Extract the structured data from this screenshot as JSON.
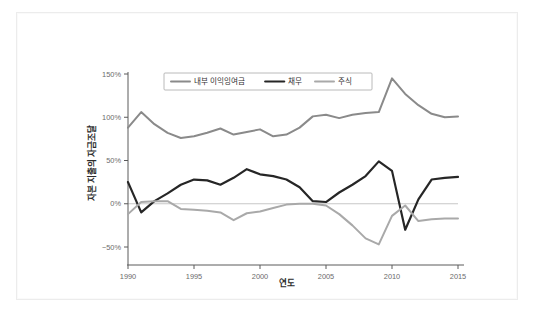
{
  "figure": {
    "background": "#ffffff",
    "frame_color": "#ececec"
  },
  "chart_data": {
    "type": "line",
    "title": "",
    "subtitle": "",
    "xlabel": "연도",
    "ylabel": "자본 지출의 자금조달",
    "xlim": [
      1990,
      2015
    ],
    "ylim": [
      -50,
      150
    ],
    "grid": false,
    "zero_line": true,
    "legend_position": "top-center-inside",
    "xticks": [
      1990,
      1995,
      2000,
      2005,
      2010,
      2015
    ],
    "xtick_labels": [
      "1990",
      "1995",
      "2000",
      "2005",
      "2010",
      "2015"
    ],
    "yticks": [
      -50,
      0,
      50,
      100,
      150
    ],
    "ytick_labels": [
      "−50%",
      "0%",
      "50%",
      "100%",
      "150%"
    ],
    "x": [
      1990,
      1991,
      1992,
      1993,
      1994,
      1995,
      1996,
      1997,
      1998,
      1999,
      2000,
      2001,
      2002,
      2003,
      2004,
      2005,
      2006,
      2007,
      2008,
      2009,
      2010,
      2011,
      2012,
      2013,
      2014,
      2015
    ],
    "series": [
      {
        "name": "내부 이익잉여금",
        "color": "#8a8a8a",
        "width": 2.0,
        "values": [
          88,
          106,
          92,
          82,
          76,
          78,
          82,
          87,
          80,
          83,
          86,
          78,
          80,
          88,
          101,
          103,
          99,
          103,
          105,
          106,
          145,
          127,
          114,
          104,
          100,
          101
        ]
      },
      {
        "name": "채무",
        "color": "#262626",
        "width": 2.2,
        "values": [
          25,
          -10,
          3,
          12,
          22,
          28,
          27,
          22,
          30,
          40,
          34,
          32,
          28,
          19,
          3,
          2,
          13,
          22,
          32,
          49,
          38,
          -30,
          5,
          28,
          30,
          31
        ]
      },
      {
        "name": "주식",
        "color": "#a9a9a9",
        "width": 2.0,
        "values": [
          -12,
          2,
          3,
          3,
          -6,
          -7,
          -8,
          -10,
          -19,
          -11,
          -9,
          -5,
          -1,
          0,
          0,
          -2,
          -12,
          -25,
          -40,
          -47,
          -14,
          -2,
          -20,
          -18,
          -17,
          -17
        ]
      }
    ]
  },
  "legend": {
    "entries": [
      {
        "label": "내부 이익잉여금",
        "color": "#8a8a8a"
      },
      {
        "label": "채무",
        "color": "#262626"
      },
      {
        "label": "주식",
        "color": "#a9a9a9"
      }
    ]
  }
}
